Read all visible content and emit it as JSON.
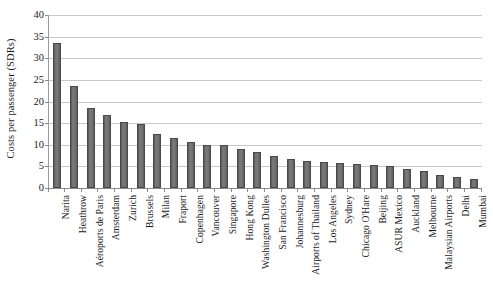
{
  "chart_data": {
    "type": "bar",
    "title": "",
    "xlabel": "",
    "ylabel": "Costs per passenger (SDRs)",
    "ylim": [
      0,
      40
    ],
    "ytick_step": 5,
    "yticks": [
      "0",
      "5",
      "10",
      "15",
      "20",
      "25",
      "30",
      "35",
      "40"
    ],
    "grid": true,
    "legend": "none",
    "bar_color": "#6d6d6d",
    "bar_edge_color": "#4a4a4a",
    "gridline_color": "#c8c8c8",
    "axis_color": "#8a8a8a",
    "categories": [
      "Narita",
      "Heathrow",
      "Aéroports de Paris",
      "Amsterdam",
      "Zurich",
      "Brussels",
      "Milan",
      "Fraport",
      "Copenhagen",
      "Vancouver",
      "Singapore",
      "Hong Kong",
      "Washington Dulles",
      "San Francisco",
      "Johannesburg",
      "Airports of Thailand",
      "Los Angeles",
      "Sydney",
      "Chicago O'Hare",
      "Beijing",
      "ASUR Mexico",
      "Auckland",
      "Melbourne",
      "Malaysian Airports",
      "Delhi",
      "Mumbai"
    ],
    "values": [
      33.6,
      23.5,
      18.4,
      16.8,
      15.3,
      14.7,
      12.5,
      11.5,
      10.6,
      10.0,
      10.0,
      9.1,
      8.3,
      7.4,
      6.7,
      6.3,
      6.1,
      5.8,
      5.5,
      5.3,
      5.2,
      4.3,
      3.9,
      3.1,
      2.6,
      2.1
    ]
  }
}
